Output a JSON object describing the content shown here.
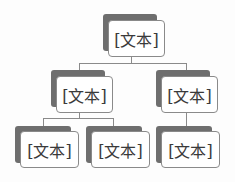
{
  "diagram": {
    "type": "hierarchy",
    "colors": {
      "shadow": "#6e6e6e",
      "box_fill": "#ffffff",
      "box_border": "#8a8a8a",
      "text": "#3a3a3a",
      "connector": "#8a8a8a"
    },
    "root": {
      "label": "[文本]",
      "children": [
        {
          "label": "[文本]",
          "children": [
            {
              "label": "[文本]"
            },
            {
              "label": "[文本]"
            }
          ]
        },
        {
          "label": "[文本]",
          "children": [
            {
              "label": "[文本]"
            }
          ]
        }
      ]
    }
  }
}
